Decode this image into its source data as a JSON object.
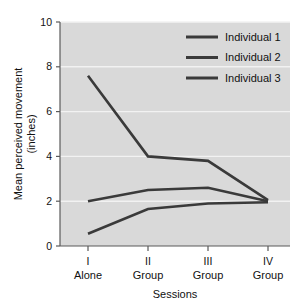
{
  "chart_data": {
    "type": "line",
    "title": "",
    "xlabel": "Sessions",
    "ylabel": "Mean perceived movement\n(inches)",
    "ylabel_line1": "Mean perceived movement",
    "ylabel_line2": "(inches)",
    "categories": [
      "I",
      "II",
      "III",
      "IV"
    ],
    "category_sublabels": [
      "Alone",
      "Group",
      "Group",
      "Group"
    ],
    "xtick_labels": [
      "I",
      "II",
      "III",
      "IV"
    ],
    "ytick_labels": [
      "0",
      "2",
      "4",
      "6",
      "8",
      "10"
    ],
    "ytick_values": [
      0,
      2,
      4,
      6,
      8,
      10
    ],
    "ylim": [
      0,
      10
    ],
    "grid": true,
    "grid_axis": "y",
    "legend_position": "top-right",
    "series": [
      {
        "name": "Individual 1",
        "values": [
          7.6,
          4.0,
          3.8,
          2.05
        ],
        "color": "#3a3a3a"
      },
      {
        "name": "Individual 2",
        "values": [
          2.0,
          2.5,
          2.6,
          2.0
        ],
        "color": "#3a3a3a"
      },
      {
        "name": "Individual 3",
        "values": [
          0.55,
          1.65,
          1.9,
          1.95
        ],
        "color": "#3a3a3a"
      }
    ]
  },
  "legend": {
    "entries": [
      {
        "label": "Individual 1"
      },
      {
        "label": "Individual 2"
      },
      {
        "label": "Individual 3"
      }
    ]
  },
  "axes": {
    "x_title": "Sessions",
    "y_title_line1": "Mean perceived movement",
    "y_title_line2": "(inches)"
  },
  "colors": {
    "plot_background": "#d9d9d9",
    "page_background": "#ffffff",
    "gridline": "#f2f2f2",
    "line": "#3a3a3a",
    "axis": "#4a4a4a",
    "text": "#111111"
  }
}
